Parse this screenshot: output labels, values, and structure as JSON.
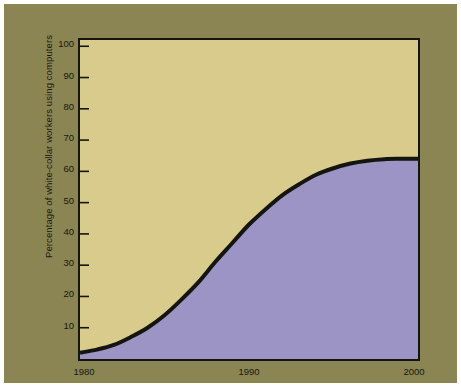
{
  "chart_data": {
    "type": "area",
    "title": "",
    "subtitle": "",
    "xlabel": "",
    "ylabel": "Percentage of white-collar workers using computers",
    "xlim": [
      1980,
      2000
    ],
    "ylim": [
      0,
      102
    ],
    "grid": false,
    "legend": null,
    "x_tick_labels": [
      "1980",
      "1990",
      "2000"
    ],
    "x_tick_values": [
      1980,
      1990,
      2000
    ],
    "y_tick_labels": [
      "10",
      "20",
      "30",
      "40",
      "50",
      "60",
      "70",
      "80",
      "90",
      "100"
    ],
    "y_tick_values": [
      10,
      20,
      30,
      40,
      50,
      60,
      70,
      80,
      90,
      100
    ],
    "series": [
      {
        "name": "Percentage of white-collar workers using computers",
        "x": [
          1980,
          1981,
          1982,
          1983,
          1984,
          1985,
          1986,
          1987,
          1988,
          1989,
          1990,
          1991,
          1992,
          1993,
          1994,
          1995,
          1996,
          1997,
          1998,
          1999,
          2000
        ],
        "values": [
          2,
          3,
          4.5,
          7,
          10,
          14,
          19,
          24.5,
          31,
          37,
          43,
          48,
          52.5,
          56,
          59,
          61,
          62.5,
          63.4,
          63.9,
          64,
          64
        ],
        "line_color": "#151510",
        "fill_below_color": "#9b94c4",
        "fill_above_color": "#d9cb8c",
        "line_width": 4
      }
    ],
    "colors": {
      "plot_background_upper": "#d9cb8c",
      "plot_fill_lower": "#9b94c4",
      "curve": "#151510",
      "frame": "#151510",
      "mat_border": "#8b8553",
      "page_background": "#ffffff",
      "tick_label": "#17170f"
    },
    "annotations": []
  }
}
